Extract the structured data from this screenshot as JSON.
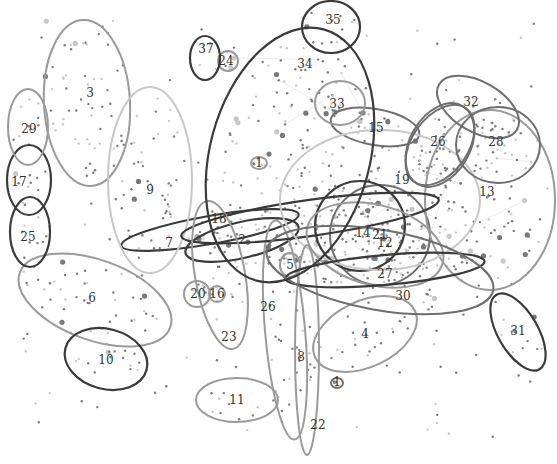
{
  "diagram": {
    "top_fragment_left": "...",
    "top_fragment_mid": "y",
    "colors": {
      "dark": "#3a3a3a",
      "mid": "#6e6e6e",
      "light": "#9a9a9a",
      "pale": "#c8c8c8",
      "dot": "#7a7a7a",
      "edge": "#e6e6e6"
    },
    "clusters": [
      {
        "id": "1a",
        "label": "1",
        "cx": 259,
        "cy": 163,
        "rx": 8,
        "ry": 6,
        "rot": 0,
        "tone": "light"
      },
      {
        "id": "1b",
        "label": "1",
        "cx": 337,
        "cy": 383,
        "rx": 6,
        "ry": 5,
        "rot": 0,
        "tone": "mid"
      },
      {
        "id": "2",
        "label": "2",
        "cx": 242,
        "cy": 240,
        "rx": 58,
        "ry": 18,
        "rot": -13,
        "tone": "dark"
      },
      {
        "id": "3",
        "label": "3",
        "cx": 87,
        "cy": 103,
        "rx": 43,
        "ry": 83,
        "rot": -3,
        "tone": "light"
      },
      {
        "id": "4",
        "label": "4",
        "cx": 365,
        "cy": 334,
        "rx": 55,
        "ry": 33,
        "rot": -25,
        "tone": "light"
      },
      {
        "id": "5",
        "label": "5",
        "cx": 290,
        "cy": 265,
        "rx": 10,
        "ry": 12,
        "rot": 0,
        "tone": "light"
      },
      {
        "id": "6",
        "label": "6",
        "cx": 95,
        "cy": 300,
        "rx": 80,
        "ry": 40,
        "rot": 20,
        "tone": "light"
      },
      {
        "id": "7",
        "label": "7",
        "cx": 210,
        "cy": 230,
        "rx": 90,
        "ry": 14,
        "rot": -10,
        "tone": "dark"
      },
      {
        "id": "8",
        "label": "8",
        "cx": 285,
        "cy": 330,
        "rx": 20,
        "ry": 110,
        "rot": -5,
        "tone": "light"
      },
      {
        "id": "9",
        "label": "9",
        "cx": 150,
        "cy": 180,
        "rx": 42,
        "ry": 93,
        "rot": 0,
        "tone": "pale"
      },
      {
        "id": "10",
        "label": "10",
        "cx": 106,
        "cy": 359,
        "rx": 42,
        "ry": 30,
        "rot": 15,
        "tone": "dark"
      },
      {
        "id": "11",
        "label": "11",
        "cx": 237,
        "cy": 400,
        "rx": 41,
        "ry": 22,
        "rot": 0,
        "tone": "light"
      },
      {
        "id": "12",
        "label": "12",
        "cx": 380,
        "cy": 235,
        "rx": 50,
        "ry": 50,
        "rot": 0,
        "tone": "mid"
      },
      {
        "id": "13",
        "label": "13",
        "cx": 490,
        "cy": 200,
        "rx": 65,
        "ry": 90,
        "rot": 0,
        "tone": "light"
      },
      {
        "id": "14",
        "label": "14",
        "cx": 360,
        "cy": 226,
        "rx": 45,
        "ry": 45,
        "rot": 0,
        "tone": "dark"
      },
      {
        "id": "15",
        "label": "15",
        "cx": 375,
        "cy": 127,
        "rx": 45,
        "ry": 18,
        "rot": 10,
        "tone": "mid"
      },
      {
        "id": "16",
        "label": "16",
        "cx": 217,
        "cy": 294,
        "rx": 8,
        "ry": 8,
        "rot": 0,
        "tone": "light"
      },
      {
        "id": "17",
        "label": "17",
        "cx": 29,
        "cy": 180,
        "rx": 22,
        "ry": 35,
        "rot": 0,
        "tone": "dark"
      },
      {
        "id": "18",
        "label": "18",
        "cx": 310,
        "cy": 218,
        "rx": 130,
        "ry": 18,
        "rot": -8,
        "tone": "dark"
      },
      {
        "id": "19",
        "label": "19",
        "cx": 380,
        "cy": 200,
        "rx": 100,
        "ry": 70,
        "rot": 0,
        "tone": "pale"
      },
      {
        "id": "20",
        "label": "20",
        "cx": 197,
        "cy": 294,
        "rx": 13,
        "ry": 13,
        "rot": 0,
        "tone": "light"
      },
      {
        "id": "21",
        "label": "21",
        "cx": 375,
        "cy": 245,
        "rx": 70,
        "ry": 40,
        "rot": 15,
        "tone": "light"
      },
      {
        "id": "22",
        "label": "22",
        "cx": 307,
        "cy": 350,
        "rx": 12,
        "ry": 105,
        "rot": 0,
        "tone": "light"
      },
      {
        "id": "23",
        "label": "23",
        "cx": 220,
        "cy": 275,
        "rx": 25,
        "ry": 75,
        "rot": -10,
        "tone": "light"
      },
      {
        "id": "24",
        "label": "24",
        "cx": 228,
        "cy": 61,
        "rx": 10,
        "ry": 10,
        "rot": 0,
        "tone": "light"
      },
      {
        "id": "25",
        "label": "25",
        "cx": 30,
        "cy": 232,
        "rx": 20,
        "ry": 35,
        "rot": 0,
        "tone": "dark"
      },
      {
        "id": "26",
        "label": "26",
        "cx": 440,
        "cy": 145,
        "rx": 30,
        "ry": 45,
        "rot": 30,
        "tone": "mid"
      },
      {
        "id": "27",
        "label": "27",
        "cx": 385,
        "cy": 270,
        "rx": 100,
        "ry": 15,
        "rot": -5,
        "tone": "dark"
      },
      {
        "id": "28",
        "label": "28",
        "cx": 498,
        "cy": 145,
        "rx": 42,
        "ry": 38,
        "rot": 0,
        "tone": "mid"
      },
      {
        "id": "29",
        "label": "29",
        "cx": 28,
        "cy": 127,
        "rx": 20,
        "ry": 38,
        "rot": 0,
        "tone": "light"
      },
      {
        "id": "30",
        "label": "30",
        "cx": 380,
        "cy": 270,
        "rx": 115,
        "ry": 40,
        "rot": 10,
        "tone": "mid"
      },
      {
        "id": "31",
        "label": "31",
        "cx": 518,
        "cy": 332,
        "rx": 20,
        "ry": 43,
        "rot": -30,
        "tone": "dark"
      },
      {
        "id": "32",
        "label": "32",
        "cx": 478,
        "cy": 107,
        "rx": 45,
        "ry": 25,
        "rot": 30,
        "tone": "mid"
      },
      {
        "id": "33",
        "label": "33",
        "cx": 340,
        "cy": 103,
        "rx": 25,
        "ry": 22,
        "rot": 0,
        "tone": "light"
      },
      {
        "id": "34",
        "label": "34",
        "cx": 290,
        "cy": 155,
        "rx": 80,
        "ry": 130,
        "rot": 15,
        "tone": "dark"
      },
      {
        "id": "35",
        "label": "35",
        "cx": 331,
        "cy": 27,
        "rx": 29,
        "ry": 26,
        "rot": 0,
        "tone": "dark"
      },
      {
        "id": "36",
        "label": "36",
        "cx": 440,
        "cy": 145,
        "rx": 28,
        "ry": 45,
        "rot": 35,
        "tone": "mid"
      },
      {
        "id": "37",
        "label": "37",
        "cx": 205,
        "cy": 58,
        "rx": 15,
        "ry": 22,
        "rot": 0,
        "tone": "dark"
      }
    ],
    "labels": [
      {
        "text": "1",
        "x": 259,
        "y": 167
      },
      {
        "text": "1",
        "x": 337,
        "y": 386
      },
      {
        "text": "2",
        "x": 242,
        "y": 244
      },
      {
        "text": "3",
        "x": 90,
        "y": 97
      },
      {
        "text": "4",
        "x": 365,
        "y": 338
      },
      {
        "text": "5",
        "x": 290,
        "y": 269
      },
      {
        "text": "6",
        "x": 92,
        "y": 302
      },
      {
        "text": "7",
        "x": 169,
        "y": 247
      },
      {
        "text": "8",
        "x": 301,
        "y": 361
      },
      {
        "text": "9",
        "x": 150,
        "y": 194
      },
      {
        "text": "10",
        "x": 106,
        "y": 364
      },
      {
        "text": "11",
        "x": 237,
        "y": 404
      },
      {
        "text": "12",
        "x": 385,
        "y": 247
      },
      {
        "text": "13",
        "x": 487,
        "y": 196
      },
      {
        "text": "14",
        "x": 363,
        "y": 237
      },
      {
        "text": "15",
        "x": 376,
        "y": 132
      },
      {
        "text": "16",
        "x": 217,
        "y": 298
      },
      {
        "text": "17",
        "x": 19,
        "y": 186
      },
      {
        "text": "18",
        "x": 219,
        "y": 223
      },
      {
        "text": "19",
        "x": 402,
        "y": 184
      },
      {
        "text": "20",
        "x": 198,
        "y": 298
      },
      {
        "text": "21",
        "x": 380,
        "y": 239
      },
      {
        "text": "22",
        "x": 318,
        "y": 429
      },
      {
        "text": "23",
        "x": 229,
        "y": 341
      },
      {
        "text": "24",
        "x": 226,
        "y": 65
      },
      {
        "text": "25",
        "x": 28,
        "y": 241
      },
      {
        "text": "26",
        "x": 438,
        "y": 146
      },
      {
        "text": "26",
        "x": 268,
        "y": 311
      },
      {
        "text": "27",
        "x": 385,
        "y": 278
      },
      {
        "text": "28",
        "x": 496,
        "y": 146
      },
      {
        "text": "29",
        "x": 29,
        "y": 133
      },
      {
        "text": "30",
        "x": 403,
        "y": 300
      },
      {
        "text": "31",
        "x": 518,
        "y": 335
      },
      {
        "text": "32",
        "x": 471,
        "y": 106
      },
      {
        "text": "33",
        "x": 337,
        "y": 108
      },
      {
        "text": "34",
        "x": 305,
        "y": 68
      },
      {
        "text": "35",
        "x": 333,
        "y": 24
      },
      {
        "text": "37",
        "x": 206,
        "y": 53
      }
    ]
  }
}
